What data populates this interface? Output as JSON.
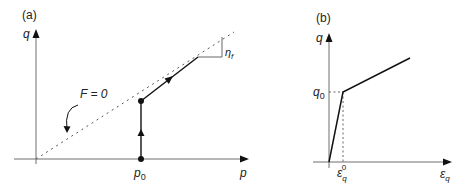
{
  "panel_a": {
    "label": "(a)",
    "y_axis_label": "q",
    "x_axis_label": "p",
    "x_tick_label": "p",
    "x_tick_sub": "0",
    "yield_surface_label": "F = 0",
    "slope_label": "η",
    "slope_sub": "f"
  },
  "panel_b": {
    "label": "(b)",
    "y_axis_label": "q",
    "y_tick_label": "q",
    "y_tick_sub": "0",
    "x_axis_label": "ε",
    "x_axis_sub": "q",
    "x_tick_label": "ε",
    "x_tick_sub": "q",
    "x_tick_sup": "0"
  },
  "colors": {
    "axis": "#6e6e6e",
    "curve": "#111111",
    "dotted": "#555555"
  }
}
